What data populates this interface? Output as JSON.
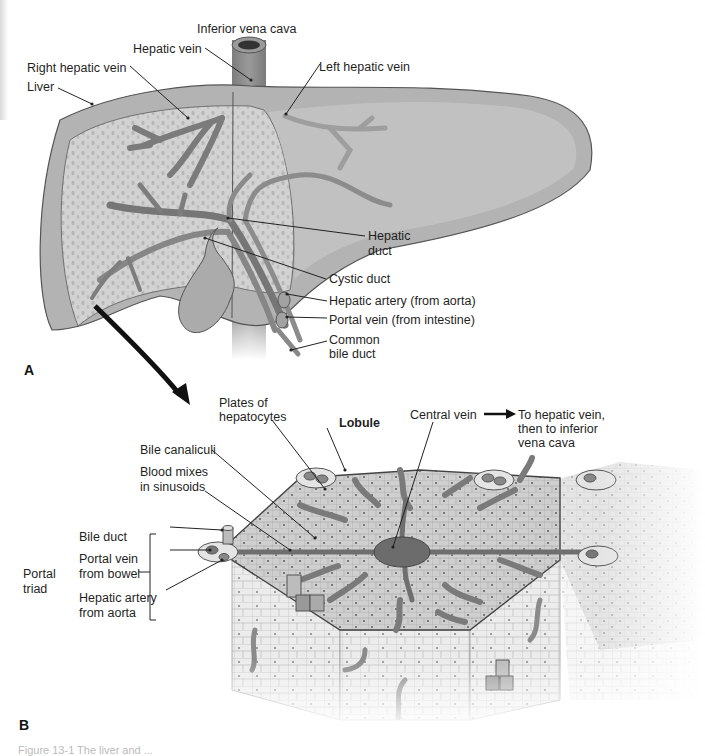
{
  "figure": {
    "panel_a": {
      "letter": "A",
      "labels": {
        "inferior_vena_cava": "Inferior vena cava",
        "hepatic_vein": "Hepatic vein",
        "right_hepatic_vein": "Right hepatic vein",
        "left_hepatic_vein": "Left hepatic vein",
        "liver": "Liver",
        "hepatic_duct_1": "Hepatic",
        "hepatic_duct_2": "duct",
        "cystic_duct": "Cystic duct",
        "hepatic_artery": "Hepatic artery (from aorta)",
        "portal_vein": "Portal vein (from intestine)",
        "common_bile_duct_1": "Common",
        "common_bile_duct_2": "bile duct"
      }
    },
    "panel_b": {
      "letter": "B",
      "labels": {
        "plates_1": "Plates of",
        "plates_2": "hepatocytes",
        "lobule": "Lobule",
        "central_vein": "Central vein",
        "to_hepatic_1": "To hepatic vein,",
        "to_hepatic_2": "then to inferior",
        "to_hepatic_3": "vena cava",
        "bile_canaliculi": "Bile canaliculi",
        "blood_mixes_1": "Blood mixes",
        "blood_mixes_2": "in sinusoids",
        "bile_duct": "Bile duct",
        "portal_vein_1": "Portal vein",
        "portal_vein_2": "from bowel",
        "hepatic_artery_1": "Hepatic artery",
        "hepatic_artery_2": "from aorta",
        "portal_triad_1": "Portal",
        "portal_triad_2": "triad"
      }
    },
    "caption": "Figure 13-1 The liver and ...",
    "colors": {
      "liver_fill": "#a9a9a9",
      "liver_light": "#cfcfcf",
      "vessel": "#8a8a8a",
      "vessel_dark": "#6e6e6e",
      "lobule_top": "#cdcdcd",
      "lobule_side": "#e6e6e6",
      "line": "#222222"
    }
  }
}
